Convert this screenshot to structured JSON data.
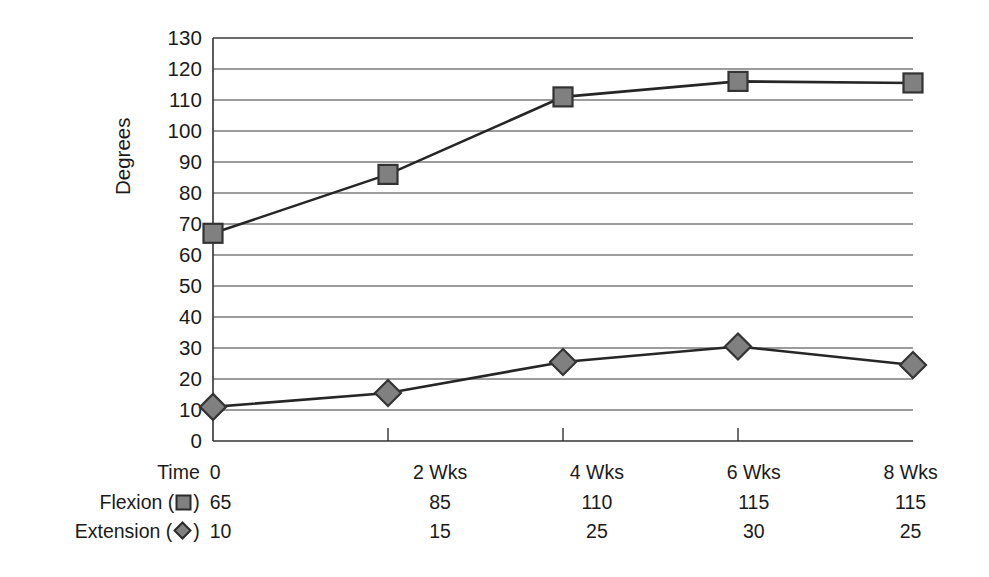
{
  "chart_data": {
    "type": "line",
    "title": "",
    "xlabel": "",
    "ylabel": "Degrees",
    "ylim": [
      0,
      130
    ],
    "ytick_step": 10,
    "yticks": [
      130,
      120,
      110,
      100,
      90,
      80,
      70,
      60,
      50,
      40,
      30,
      20,
      10,
      0
    ],
    "categories": [
      "0",
      "2 Wks",
      "4 Wks",
      "6 Wks",
      "8 Wks"
    ],
    "grid": "horizontal",
    "legend": "inline-table",
    "series": [
      {
        "name": "Flexion",
        "marker": "square",
        "color": "#808080",
        "edge_color": "#333333",
        "values": [
          65,
          85,
          110,
          115,
          115
        ],
        "plotted": [
          67,
          86,
          111,
          116,
          115.5
        ]
      },
      {
        "name": "Extension",
        "marker": "diamond",
        "color": "#808080",
        "edge_color": "#333333",
        "values": [
          10,
          15,
          25,
          30,
          25
        ],
        "plotted": [
          11,
          15.5,
          25.5,
          30.5,
          24.5
        ]
      }
    ]
  },
  "table": {
    "rows": [
      {
        "label": "Time",
        "marker": "none",
        "values": [
          "0",
          "2 Wks",
          "4 Wks",
          "6 Wks",
          "8 Wks"
        ]
      },
      {
        "label": "Flexion",
        "marker": "square",
        "values": [
          "65",
          "85",
          "110",
          "115",
          "115"
        ]
      },
      {
        "label": "Extension",
        "marker": "diamond",
        "values": [
          "10",
          "15",
          "25",
          "30",
          "25"
        ]
      }
    ],
    "label_open_paren": " (",
    "label_close_paren": ")"
  },
  "colors": {
    "axis": "#333333",
    "grid": "#3a3a3a",
    "marker_fill": "#808080",
    "marker_edge": "#2b2b2b",
    "line": "#262626",
    "text": "#1a1a1a",
    "background": "#ffffff"
  },
  "icons": {
    "square_marker": "square-marker-icon",
    "diamond_marker": "diamond-marker-icon"
  }
}
